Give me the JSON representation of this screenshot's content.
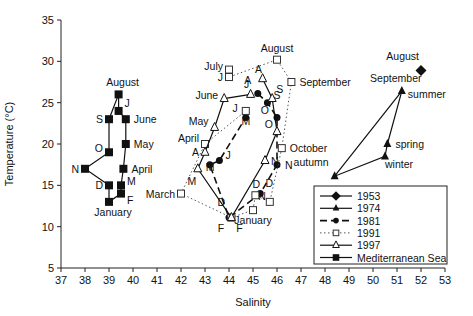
{
  "chart_data": {
    "type": "scatter",
    "title": "",
    "xlabel": "Salinity",
    "ylabel": "Temperature (°C)",
    "xlim": [
      37,
      53
    ],
    "ylim": [
      5,
      35
    ],
    "xticks": [
      37,
      38,
      39,
      40,
      41,
      42,
      43,
      44,
      45,
      46,
      47,
      48,
      49,
      50,
      51,
      52,
      53
    ],
    "yticks": [
      5,
      10,
      15,
      20,
      25,
      30,
      35
    ],
    "grid": false,
    "legend_position": "lower right",
    "legend": [
      "1953",
      "1974",
      "1981",
      "1991",
      "1997",
      "Mediterranean Sea"
    ],
    "series": [
      {
        "name": "1953",
        "marker": "diamond",
        "line": "solid",
        "points": [
          {
            "x": 52.0,
            "y": 28.9,
            "label": "August"
          }
        ]
      },
      {
        "name": "1974",
        "marker": "triangle-filled",
        "line": "solid",
        "points": [
          {
            "x": 51.2,
            "y": 26.4,
            "label": "September summer"
          },
          {
            "x": 50.6,
            "y": 20.0,
            "label": "spring"
          },
          {
            "x": 50.5,
            "y": 18.5,
            "label": "winter"
          },
          {
            "x": 48.4,
            "y": 16.1,
            "label": "autumn"
          }
        ],
        "path_order": [
          0,
          1,
          2,
          3,
          0
        ]
      },
      {
        "name": "1981",
        "marker": "circle-filled",
        "line": "dashed",
        "points": [
          {
            "x": 45.2,
            "y": 26.1,
            "label": "A"
          },
          {
            "x": 45.6,
            "y": 25.0,
            "label": "S"
          },
          {
            "x": 46.0,
            "y": 23.2,
            "label": "O"
          },
          {
            "x": 46.0,
            "y": 17.5,
            "label": "N"
          },
          {
            "x": 45.3,
            "y": 14.0,
            "label": "D"
          },
          {
            "x": 44.0,
            "y": 11.1,
            "label": "F"
          },
          {
            "x": 43.2,
            "y": 17.5,
            "label": "M"
          },
          {
            "x": 43.6,
            "y": 18.0,
            "label": "J"
          },
          {
            "x": 44.7,
            "y": 23.2,
            "label": "J"
          }
        ]
      },
      {
        "name": "1991",
        "marker": "square-open",
        "line": "dotted",
        "points": [
          {
            "x": 44.0,
            "y": 29.0,
            "label": "July"
          },
          {
            "x": 44.0,
            "y": 28.1,
            "label": "J"
          },
          {
            "x": 46.0,
            "y": 30.2,
            "label": "August"
          },
          {
            "x": 46.6,
            "y": 27.5,
            "label": "September"
          },
          {
            "x": 46.2,
            "y": 19.5,
            "label": "October"
          },
          {
            "x": 45.7,
            "y": 13.0,
            "label": "N"
          },
          {
            "x": 45.1,
            "y": 13.8,
            "label": "D"
          },
          {
            "x": 45.0,
            "y": 12.0,
            "label": "January"
          },
          {
            "x": 44.1,
            "y": 11.1,
            "label": "F"
          },
          {
            "x": 42.0,
            "y": 14.0,
            "label": "March"
          },
          {
            "x": 43.0,
            "y": 20.0,
            "label": "April"
          },
          {
            "x": 44.7,
            "y": 24.0,
            "label": "M"
          }
        ]
      },
      {
        "name": "1997",
        "marker": "triangle-open",
        "line": "solid",
        "points": [
          {
            "x": 45.4,
            "y": 27.9,
            "label": "A"
          },
          {
            "x": 45.8,
            "y": 25.5,
            "label": "S"
          },
          {
            "x": 46.0,
            "y": 21.5,
            "label": "O"
          },
          {
            "x": 45.5,
            "y": 18.0,
            "label": "N"
          },
          {
            "x": 44.1,
            "y": 11.1,
            "label": "D"
          },
          {
            "x": 42.7,
            "y": 17.0,
            "label": "M"
          },
          {
            "x": 43.0,
            "y": 19.0,
            "label": "A"
          },
          {
            "x": 43.4,
            "y": 22.0,
            "label": "May"
          },
          {
            "x": 43.8,
            "y": 25.5,
            "label": "June"
          },
          {
            "x": 44.9,
            "y": 26.0,
            "label": "J"
          }
        ]
      },
      {
        "name": "Mediterranean Sea",
        "marker": "square-filled",
        "line": "solid",
        "points": [
          {
            "x": 39.4,
            "y": 26.0,
            "label": "August"
          },
          {
            "x": 39.0,
            "y": 23.0,
            "label": "S"
          },
          {
            "x": 39.0,
            "y": 19.0,
            "label": "O"
          },
          {
            "x": 38.0,
            "y": 17.0,
            "label": "N"
          },
          {
            "x": 39.0,
            "y": 15.0,
            "label": "D"
          },
          {
            "x": 39.0,
            "y": 13.0,
            "label": "January"
          },
          {
            "x": 39.5,
            "y": 14.0,
            "label": "F"
          },
          {
            "x": 39.5,
            "y": 15.0,
            "label": "M"
          },
          {
            "x": 39.6,
            "y": 17.0,
            "label": "April"
          },
          {
            "x": 39.7,
            "y": 20.0,
            "label": "May"
          },
          {
            "x": 39.7,
            "y": 23.0,
            "label": "June"
          },
          {
            "x": 39.4,
            "y": 24.0,
            "label": "J"
          }
        ],
        "path_order": [
          0,
          1,
          2,
          3,
          4,
          5,
          6,
          7,
          8,
          9,
          10,
          11,
          0
        ]
      }
    ]
  }
}
